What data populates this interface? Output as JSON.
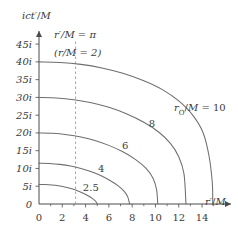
{
  "chart_data": {
    "type": "line",
    "title": "",
    "xlabel": "r'/M",
    "ylabel": "ict'/M",
    "xlim": [
      0,
      15.8
    ],
    "ylim": [
      0,
      47
    ],
    "grid": false,
    "legend": "inline-curve-labels",
    "xticks": [
      0,
      2,
      4,
      6,
      8,
      10,
      12,
      14
    ],
    "xticklabels": [
      "0",
      "2",
      "4",
      "6",
      "8",
      "10",
      "12",
      "14"
    ],
    "yticks": [
      0,
      5,
      10,
      15,
      20,
      25,
      30,
      35,
      40,
      45
    ],
    "yticklabels": [
      "0",
      "5i",
      "10i",
      "15i",
      "20i",
      "25i",
      "30i",
      "35i",
      "40i",
      "45i"
    ],
    "annotations": [
      {
        "name": "r-prime-pi-label",
        "text": "r'/M = π",
        "x": 4.0,
        "y": 44.5
      },
      {
        "name": "r-over-m-two-label",
        "text": "(r/M = 2)",
        "x": 4.0,
        "y": 40.6
      },
      {
        "name": "horizon-dashed-line",
        "text": "",
        "x": 3.14159,
        "y": 0
      }
    ],
    "dashed_vertical_x": 3.14159,
    "series": [
      {
        "name": "r0/M = 2.5",
        "label": "2.5",
        "label_x": 4.45,
        "label_y": 3.6,
        "y_intercept": 5.5,
        "x_intercept": 5.02,
        "points": [
          [
            0,
            5.5
          ],
          [
            0.55,
            5.46
          ],
          [
            1.1,
            5.33
          ],
          [
            1.65,
            5.12
          ],
          [
            2.2,
            4.8
          ],
          [
            2.75,
            4.35
          ],
          [
            3.3,
            3.75
          ],
          [
            3.8,
            3.05
          ],
          [
            4.25,
            2.25
          ],
          [
            4.6,
            1.5
          ],
          [
            4.85,
            0.8
          ],
          [
            5.02,
            0
          ]
        ]
      },
      {
        "name": "r0/M = 4",
        "label": "4",
        "label_x": 5.35,
        "label_y": 9.1,
        "y_intercept": 11.5,
        "x_intercept": 7.78,
        "points": [
          [
            0,
            11.5
          ],
          [
            0.9,
            11.42
          ],
          [
            1.8,
            11.15
          ],
          [
            2.7,
            10.7
          ],
          [
            3.6,
            10.0
          ],
          [
            4.5,
            9.1
          ],
          [
            5.3,
            8.0
          ],
          [
            6.1,
            6.6
          ],
          [
            6.8,
            5.1
          ],
          [
            7.3,
            3.6
          ],
          [
            7.62,
            2.0
          ],
          [
            7.78,
            0
          ]
        ]
      },
      {
        "name": "r0/M = 6",
        "label": "6",
        "label_x": 7.4,
        "label_y": 15.6,
        "y_intercept": 20.0,
        "x_intercept": 10.2,
        "points": [
          [
            0,
            20.0
          ],
          [
            1.2,
            19.9
          ],
          [
            2.4,
            19.5
          ],
          [
            3.6,
            18.85
          ],
          [
            4.8,
            17.9
          ],
          [
            6.0,
            16.5
          ],
          [
            7.2,
            14.7
          ],
          [
            8.3,
            12.5
          ],
          [
            9.2,
            10.0
          ],
          [
            9.8,
            7.2
          ],
          [
            10.1,
            4.0
          ],
          [
            10.2,
            0
          ]
        ]
      },
      {
        "name": "r0/M = 8",
        "label": "8",
        "label_x": 9.7,
        "label_y": 21.8,
        "y_intercept": 30.0,
        "x_intercept": 12.62,
        "points": [
          [
            0,
            30.0
          ],
          [
            1.5,
            29.85
          ],
          [
            3.0,
            29.35
          ],
          [
            4.5,
            28.5
          ],
          [
            6.0,
            27.2
          ],
          [
            7.5,
            25.4
          ],
          [
            9.0,
            23.0
          ],
          [
            10.3,
            20.2
          ],
          [
            11.3,
            17.0
          ],
          [
            12.0,
            13.3
          ],
          [
            12.45,
            8.5
          ],
          [
            12.62,
            0
          ]
        ]
      },
      {
        "name": "r0/M = 10",
        "label": "r₀/M = 10",
        "label_x": 11.6,
        "label_y": 26.1,
        "y_intercept": 40.0,
        "x_intercept": 14.92,
        "points": [
          [
            0,
            40.0
          ],
          [
            1.8,
            39.85
          ],
          [
            3.6,
            39.3
          ],
          [
            5.4,
            38.3
          ],
          [
            7.2,
            36.8
          ],
          [
            9.0,
            34.7
          ],
          [
            10.6,
            32.2
          ],
          [
            12.0,
            29.0
          ],
          [
            13.2,
            25.0
          ],
          [
            14.1,
            20.0
          ],
          [
            14.6,
            13.5
          ],
          [
            14.88,
            6.0
          ],
          [
            14.92,
            0
          ]
        ]
      }
    ]
  },
  "colors": {
    "axis": "#4a4a4a",
    "curve": "#6e6e6e",
    "dashed": "#9a9a9a",
    "text": "#3a3a3a"
  }
}
